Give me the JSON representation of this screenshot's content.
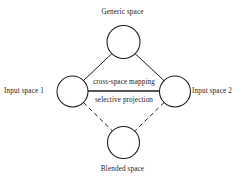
{
  "diagram": {
    "background_color": "#ffffff",
    "stroke_color": "#1c1c1c",
    "text_color": "#1c1c1c",
    "nodes": [
      {
        "id": "generic-space",
        "label": "Generic space",
        "shape": "circle",
        "cx": 123.5,
        "cy": 42,
        "r": 16.5,
        "label_position": "above"
      },
      {
        "id": "input-space-1",
        "label": "Input space 1",
        "shape": "circle",
        "cx": 72.5,
        "cy": 91.5,
        "r": 15.5,
        "label_position": "left"
      },
      {
        "id": "input-space-2",
        "label": "Input space 2",
        "shape": "circle",
        "cx": 175,
        "cy": 91.5,
        "r": 15.5,
        "label_position": "right"
      },
      {
        "id": "blended-space",
        "label": "Blended space",
        "shape": "circle",
        "cx": 123.5,
        "cy": 142.5,
        "r": 16,
        "label_position": "below"
      }
    ],
    "edges": [
      {
        "id": "generic-to-input1",
        "from": "generic-space",
        "to": "input-space-1",
        "style": "solid"
      },
      {
        "id": "generic-to-input2",
        "from": "generic-space",
        "to": "input-space-2",
        "style": "solid"
      },
      {
        "id": "input1-to-blended",
        "from": "input-space-1",
        "to": "blended-space",
        "style": "dashed"
      },
      {
        "id": "input2-to-blended",
        "from": "input-space-2",
        "to": "blended-space",
        "style": "dashed"
      },
      {
        "id": "input1-to-input2",
        "from": "input-space-1",
        "to": "input-space-2",
        "style": "solid",
        "label_above": "cross-space mapping",
        "label_below": "selective projection"
      }
    ],
    "edge_labels": {
      "cross_space_mapping": "cross-space mapping",
      "selective_projection": "selective projection"
    }
  }
}
